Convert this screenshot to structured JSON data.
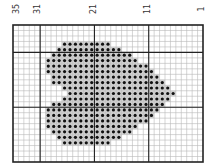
{
  "chart_data": {
    "type": "heatmap",
    "title": "",
    "columns": 35,
    "rows": 25,
    "column_numbering": "right-to-left, 1 at right edge, 35 at left edge",
    "column_labels": [
      {
        "label": "35",
        "column": 35
      },
      {
        "label": "31",
        "column": 31
      },
      {
        "label": "21",
        "column": 21
      },
      {
        "label": "11",
        "column": 11
      },
      {
        "label": "1",
        "column": 1
      }
    ],
    "major_gridline_every_cols": 10,
    "major_vertical_lines_after_columns": [
      31,
      21,
      11
    ],
    "major_horizontal_lines_after_rows": [
      5,
      15
    ],
    "filled_cells_by_row": [
      {
        "row": 4,
        "from_col": 26,
        "to_col": 18
      },
      {
        "row": 5,
        "from_col": 27,
        "to_col": 16
      },
      {
        "row": 6,
        "from_col": 28,
        "to_col": 14
      },
      {
        "row": 7,
        "from_col": 29,
        "to_col": 13
      },
      {
        "row": 8,
        "from_col": 29,
        "to_col": 11
      },
      {
        "row": 9,
        "from_col": 29,
        "to_col": 10
      },
      {
        "row": 10,
        "from_col": 28,
        "to_col": 9
      },
      {
        "row": 11,
        "from_col": 28,
        "to_col": 8
      },
      {
        "row": 12,
        "from_col": 26,
        "to_col": 7
      },
      {
        "row": 13,
        "from_col": 25,
        "to_col": 6
      },
      {
        "row": 14,
        "from_col": 26,
        "to_col": 7
      },
      {
        "row": 15,
        "from_col": 28,
        "to_col": 8
      },
      {
        "row": 16,
        "from_col": 29,
        "to_col": 9
      },
      {
        "row": 17,
        "from_col": 29,
        "to_col": 10
      },
      {
        "row": 18,
        "from_col": 29,
        "to_col": 11
      },
      {
        "row": 19,
        "from_col": 29,
        "to_col": 13
      },
      {
        "row": 20,
        "from_col": 28,
        "to_col": 14
      },
      {
        "row": 21,
        "from_col": 27,
        "to_col": 16
      },
      {
        "row": 22,
        "from_col": 26,
        "to_col": 18
      }
    ],
    "fill_index_ranges": [
      [
        3,
        9,
        17
      ],
      [
        4,
        8,
        19
      ],
      [
        5,
        7,
        21
      ],
      [
        6,
        6,
        22
      ],
      [
        7,
        6,
        24
      ],
      [
        8,
        6,
        25
      ],
      [
        9,
        7,
        26
      ],
      [
        10,
        7,
        27
      ],
      [
        11,
        9,
        28
      ],
      [
        12,
        10,
        29
      ],
      [
        13,
        9,
        28
      ],
      [
        14,
        7,
        27
      ],
      [
        15,
        6,
        26
      ],
      [
        16,
        6,
        25
      ],
      [
        17,
        6,
        24
      ],
      [
        18,
        6,
        22
      ],
      [
        19,
        7,
        21
      ],
      [
        20,
        8,
        19
      ],
      [
        21,
        9,
        17
      ]
    ],
    "colors": {
      "grid_minor": "#b8b8b8",
      "grid_major": "#222222",
      "border": "#222222",
      "dot": "#111111",
      "cell_fill": "#d4d4d4"
    }
  }
}
